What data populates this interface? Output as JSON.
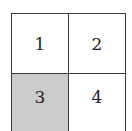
{
  "diagram": {
    "type": "2x2 grid",
    "cells": [
      {
        "label": "1",
        "row": 1,
        "col": 1,
        "shaded": false
      },
      {
        "label": "2",
        "row": 1,
        "col": 2,
        "shaded": false
      },
      {
        "label": "3",
        "row": 2,
        "col": 1,
        "shaded": true
      },
      {
        "label": "4",
        "row": 2,
        "col": 2,
        "shaded": false
      }
    ],
    "colors": {
      "border": "#3a3a3a",
      "shaded_fill": "#d8d8d8",
      "background": "#ffffff"
    }
  }
}
